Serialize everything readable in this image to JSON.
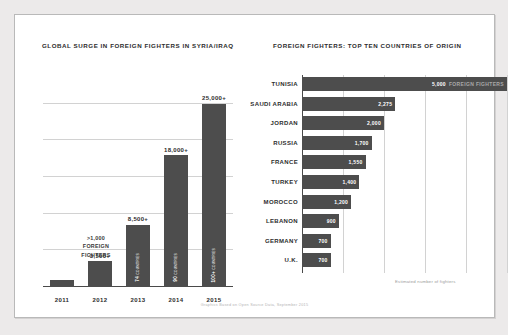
{
  "card": {
    "left_panel_title": "GLOBAL SURGE IN FOREIGN FIGHTERS IN SYRIA/IRAQ",
    "right_panel_title": "FOREIGN FIGHTERS: TOP TEN COUNTRIES OF ORIGIN",
    "right_caption": "Estimated number of fighters",
    "source_note": "Graphics Based on Open Source Data, September 2015",
    "first_bar_note_line1": ">1,000",
    "first_bar_note_line2": "FOREIGN",
    "first_bar_note_line3": "FIGHTERS"
  },
  "colors": {
    "bar": "#4d4d4d",
    "gridline": "#d2d2d2",
    "axis": "#4a4a4a",
    "card_bg": "#ffffff",
    "page_bg": "#eceaea",
    "value_text": "#2d2d2d",
    "muted_text": "#a8a8a8"
  },
  "chart_data": [
    {
      "type": "bar",
      "title": "GLOBAL SURGE IN FOREIGN FIGHTERS IN SYRIA/IRAQ",
      "orientation": "vertical",
      "xlabel": "",
      "ylabel": "",
      "ylim": [
        0,
        27000
      ],
      "grid": true,
      "categories": [
        "2011",
        "2012",
        "2013",
        "2014",
        "2015"
      ],
      "values": [
        1000,
        3500,
        8500,
        18000,
        25000
      ],
      "value_labels": [
        ">1,000",
        "3,500+",
        "8,500+",
        "18,000+",
        "25,000+"
      ],
      "bar_annotations": [
        {
          "year": "2011",
          "text": "",
          "sub": ""
        },
        {
          "year": "2012",
          "text": "",
          "sub": ""
        },
        {
          "year": "2013",
          "text": "74",
          "sub": "COUNTRIES"
        },
        {
          "year": "2014",
          "text": "90",
          "sub": "COUNTRIES"
        },
        {
          "year": "2015",
          "text": "100+",
          "sub": "COUNTRIES"
        }
      ]
    },
    {
      "type": "bar",
      "title": "FOREIGN FIGHTERS: TOP TEN COUNTRIES OF ORIGIN",
      "orientation": "horizontal",
      "xlabel": "Estimated number of fighters",
      "ylabel": "",
      "xlim": [
        0,
        5000
      ],
      "grid": true,
      "categories": [
        "TUNISIA",
        "SAUDI ARABIA",
        "JORDAN",
        "RUSSIA",
        "FRANCE",
        "TURKEY",
        "MOROCCO",
        "LEBANON",
        "GERMANY",
        "U.K."
      ],
      "values": [
        5000,
        2275,
        2000,
        1700,
        1550,
        1400,
        1200,
        900,
        700,
        700
      ],
      "value_labels": [
        "5,000",
        "2,275",
        "2,000",
        "1,700",
        "1,550",
        "1,400",
        "1,200",
        "900",
        "700",
        "700"
      ],
      "unit_suffix": "FOREIGN FIGHTERS",
      "unit_on_index": 0
    }
  ]
}
